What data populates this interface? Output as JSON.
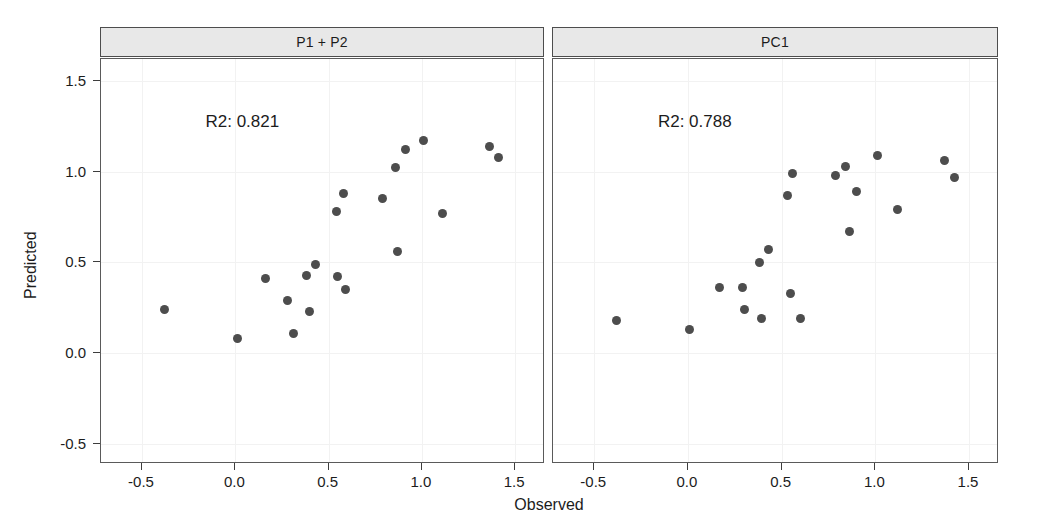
{
  "figure": {
    "width": 1044,
    "height": 532,
    "background": "#ffffff",
    "point_color": "#4d4d4d",
    "strip_fill": "#e8e8e8",
    "strip_border": "#4d4d4d",
    "panel_border": "#5a5a5a",
    "grid_color": "#f2f2f2",
    "xlabel": "Observed",
    "ylabel": "Predicted",
    "x_ticks": [
      -0.5,
      0.0,
      0.5,
      1.0,
      1.5
    ],
    "x_tick_labels": [
      "-0.5",
      "0.0",
      "0.5",
      "1.0",
      "1.5"
    ],
    "y_ticks": [
      -0.5,
      0.0,
      0.5,
      1.0,
      1.5
    ],
    "y_tick_labels": [
      "-0.5",
      "0.0",
      "0.5",
      "1.0",
      "1.5"
    ],
    "xlim": [
      -0.72,
      1.66
    ],
    "ylim": [
      -0.61,
      1.62
    ]
  },
  "chart_data": {
    "type": "scatter",
    "title": "",
    "xlabel": "Observed",
    "ylabel": "Predicted",
    "xlim": [
      -0.72,
      1.66
    ],
    "ylim": [
      -0.61,
      1.62
    ],
    "grid": true,
    "legend": "none",
    "layout": "1 row x 2 columns of faceted panels sharing x and y axes",
    "panels": [
      {
        "strip_label": "P1 + P2",
        "annotation": "R2: 0.821",
        "r2": 0.821,
        "n_points": 20,
        "points": [
          {
            "x": -0.38,
            "y": 0.24
          },
          {
            "x": 0.01,
            "y": 0.08
          },
          {
            "x": 0.16,
            "y": 0.41
          },
          {
            "x": 0.28,
            "y": 0.29
          },
          {
            "x": 0.31,
            "y": 0.11
          },
          {
            "x": 0.38,
            "y": 0.43
          },
          {
            "x": 0.4,
            "y": 0.23
          },
          {
            "x": 0.43,
            "y": 0.49
          },
          {
            "x": 0.54,
            "y": 0.78
          },
          {
            "x": 0.55,
            "y": 0.42
          },
          {
            "x": 0.58,
            "y": 0.88
          },
          {
            "x": 0.59,
            "y": 0.35
          },
          {
            "x": 0.79,
            "y": 0.85
          },
          {
            "x": 0.86,
            "y": 1.02
          },
          {
            "x": 0.87,
            "y": 0.56
          },
          {
            "x": 0.91,
            "y": 1.12
          },
          {
            "x": 1.01,
            "y": 1.17
          },
          {
            "x": 1.11,
            "y": 0.77
          },
          {
            "x": 1.36,
            "y": 1.14
          },
          {
            "x": 1.41,
            "y": 1.08
          }
        ]
      },
      {
        "strip_label": "PC1",
        "annotation": "R2: 0.788",
        "r2": 0.788,
        "n_points": 20,
        "points": [
          {
            "x": -0.38,
            "y": 0.18
          },
          {
            "x": 0.01,
            "y": 0.13
          },
          {
            "x": 0.17,
            "y": 0.36
          },
          {
            "x": 0.29,
            "y": 0.36
          },
          {
            "x": 0.3,
            "y": 0.24
          },
          {
            "x": 0.38,
            "y": 0.5
          },
          {
            "x": 0.39,
            "y": 0.19
          },
          {
            "x": 0.43,
            "y": 0.57
          },
          {
            "x": 0.53,
            "y": 0.87
          },
          {
            "x": 0.55,
            "y": 0.33
          },
          {
            "x": 0.56,
            "y": 0.99
          },
          {
            "x": 0.6,
            "y": 0.19
          },
          {
            "x": 0.79,
            "y": 0.98
          },
          {
            "x": 0.84,
            "y": 1.03
          },
          {
            "x": 0.86,
            "y": 0.67
          },
          {
            "x": 0.9,
            "y": 0.89
          },
          {
            "x": 1.01,
            "y": 1.09
          },
          {
            "x": 1.12,
            "y": 0.79
          },
          {
            "x": 1.37,
            "y": 1.06
          },
          {
            "x": 1.42,
            "y": 0.97
          }
        ]
      }
    ]
  }
}
